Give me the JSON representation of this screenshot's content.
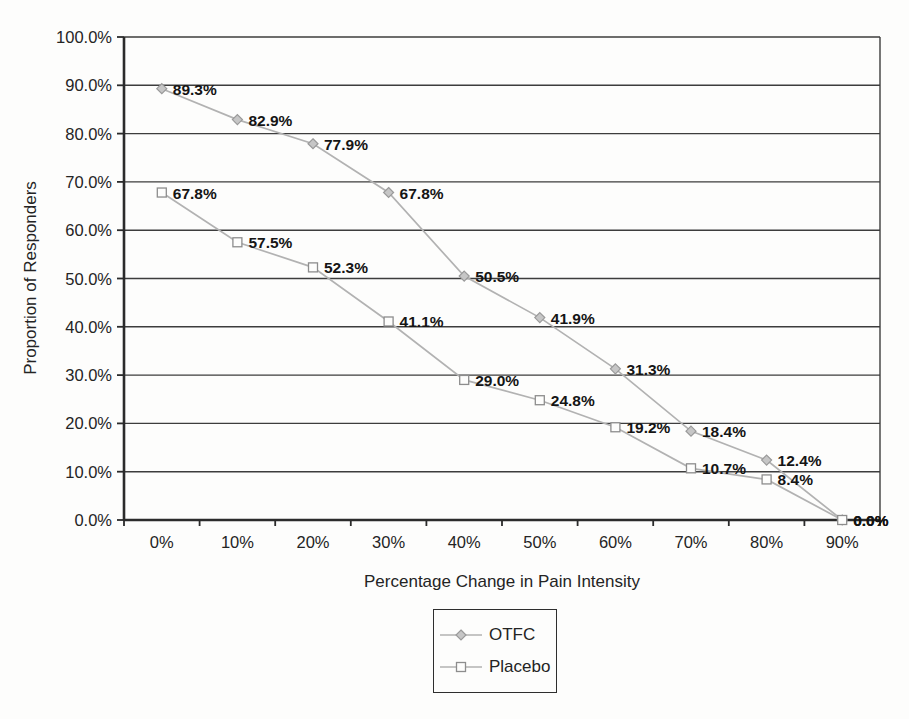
{
  "chart_data": {
    "type": "line",
    "title": "",
    "xlabel": "Percentage Change in Pain Intensity",
    "ylabel": "Proportion of Responders",
    "categories": [
      "0%",
      "10%",
      "20%",
      "30%",
      "40%",
      "50%",
      "60%",
      "70%",
      "80%",
      "90%"
    ],
    "series": [
      {
        "name": "OTFC",
        "marker": "diamond",
        "values": [
          89.3,
          82.9,
          77.9,
          67.8,
          50.5,
          41.9,
          31.3,
          18.4,
          12.4,
          0.0
        ],
        "labels": [
          "89.3%",
          "82.9%",
          "77.9%",
          "67.8%",
          "50.5%",
          "41.9%",
          "31.3%",
          "18.4%",
          "12.4%",
          "0.0%"
        ]
      },
      {
        "name": "Placebo",
        "marker": "square",
        "values": [
          67.8,
          57.5,
          52.3,
          41.1,
          29.0,
          24.8,
          19.2,
          10.7,
          8.4,
          0.0
        ],
        "labels": [
          "67.8%",
          "57.5%",
          "52.3%",
          "41.1%",
          "29.0%",
          "24.8%",
          "19.2%",
          "10.7%",
          "8.4%",
          "0.0%"
        ]
      }
    ],
    "y_ticks": [
      "100.0%",
      "90.0%",
      "80.0%",
      "70.0%",
      "60.0%",
      "50.0%",
      "40.0%",
      "30.0%",
      "20.0%",
      "10.0%",
      "0.0%"
    ],
    "ylim": [
      0,
      100
    ],
    "y_step": 10,
    "grid": "horizontal",
    "legend_position": "bottom-center",
    "colors": {
      "series_line": "#b2b2b2",
      "otfc_marker_fill": "#c6c6c6",
      "otfc_marker_stroke": "#9a9a9a",
      "placebo_marker_fill": "#fdfdfc",
      "placebo_marker_stroke": "#8d8d8d",
      "gridline": "#3d3d3d",
      "axis": "#2b2b2b",
      "tick_label": "#242424",
      "data_label": "#151515"
    }
  }
}
